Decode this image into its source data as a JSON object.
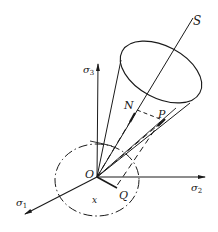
{
  "diagram": {
    "type": "stress-space cone diagram",
    "colors": {
      "stroke": "#1a1a1a",
      "background": "#ffffff"
    },
    "labels": {
      "sigma1": {
        "base": "σ",
        "sub": "1"
      },
      "sigma2": {
        "base": "σ",
        "sub": "2"
      },
      "sigma3": {
        "base": "σ",
        "sub": "3"
      },
      "origin": "O",
      "axis_S": "S",
      "point_N": "N",
      "point_P": "P",
      "point_Q": "Q",
      "angle_x": "x"
    }
  }
}
